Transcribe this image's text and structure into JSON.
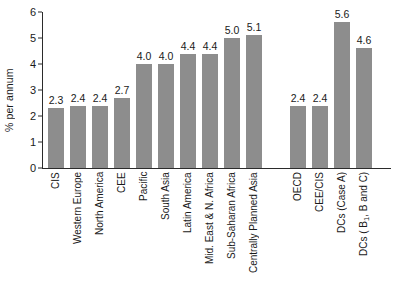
{
  "chart_data": {
    "type": "bar",
    "title": "",
    "xlabel": "",
    "ylabel": "% per annum",
    "ylim": [
      0,
      6
    ],
    "yticks": [
      0,
      1,
      2,
      3,
      4,
      5,
      6
    ],
    "grid": false,
    "legend": "none",
    "orientation": "vertical",
    "bar_color": "#8d8d8d",
    "categories": [
      "CIS",
      "Western Europe",
      "North America",
      "CEE",
      "Pacific",
      "South Asia",
      "Latin America",
      "Mid. East & N. Africa",
      "Sub-Saharan Africa",
      "Centrally Planned Asia",
      "OECD",
      "CEE/CIS",
      "DCs (Case A)",
      "DCs ( B1, B and C)",
      "World (Case A)",
      "World ( B1,B and C)"
    ],
    "values": [
      2.3,
      2.4,
      2.4,
      2.7,
      4.0,
      4.0,
      4.4,
      4.4,
      5.0,
      5.1,
      2.4,
      2.4,
      5.6,
      4.6,
      3.8,
      3.3
    ],
    "value_labels": [
      "2.3",
      "2.4",
      "2.4",
      "2.7",
      "4.0",
      "4.0",
      "4.4",
      "4.4",
      "5.0",
      "5.1",
      "2.4",
      "2.4",
      "5.6",
      "4.6",
      "3.8",
      "3.30"
    ],
    "groups": [
      {
        "name": "regions",
        "count": 10
      },
      {
        "name": "aggregates",
        "count": 4
      },
      {
        "name": "world",
        "count": 2
      }
    ]
  },
  "axis": {
    "y_title": "% per annum",
    "y_ticks": [
      "0",
      "1",
      "2",
      "3",
      "4",
      "5",
      "6"
    ]
  },
  "x_labels": [
    {
      "text": "CIS",
      "html": "CIS"
    },
    {
      "text": "Western Europe",
      "html": "Western Europe"
    },
    {
      "text": "North America",
      "html": "North America"
    },
    {
      "text": "CEE",
      "html": "CEE"
    },
    {
      "text": "Pacific",
      "html": "Pacific"
    },
    {
      "text": "South Asia",
      "html": "South Asia"
    },
    {
      "text": "Latin America",
      "html": "Latin America"
    },
    {
      "text": "Mid. East & N. Africa",
      "html": "Mid. East &amp; N. Africa"
    },
    {
      "text": "Sub-Saharan Africa",
      "html": "Sub-Saharan Africa"
    },
    {
      "text": "Centrally Planned Asia",
      "html": "Centrally Planned Asia"
    },
    {
      "text": "OECD",
      "html": "OECD"
    },
    {
      "text": "CEE/CIS",
      "html": "CEE/CIS"
    },
    {
      "text": "DCs (Case A)",
      "html": "DCs (Case A)"
    },
    {
      "text": "DCs ( B1, B and C)",
      "html": "DCs ( B<sub>1</sub>, B and C)"
    },
    {
      "text": "World (Case A)",
      "html": "World (Case A)"
    },
    {
      "text": "World ( B1,B and C)",
      "html": "World ( B<sub>1</sub>,B and C)"
    }
  ]
}
